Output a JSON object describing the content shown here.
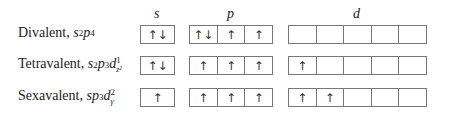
{
  "headers": {
    "s": "s",
    "p": "p",
    "d": "d"
  },
  "rows": [
    {
      "name": "Divalent, ",
      "config": [
        {
          "t": "s",
          "sup": "2"
        },
        {
          "t": "p",
          "sup": "4"
        }
      ],
      "s": [
        "↑↓"
      ],
      "p": [
        "↑↓",
        "↑",
        "↑"
      ],
      "d": [
        "",
        "",
        "",
        "",
        ""
      ]
    },
    {
      "name": "Tetravalent, ",
      "config": [
        {
          "t": "s",
          "sup": "2"
        },
        {
          "t": "p",
          "sup": "3"
        },
        {
          "t": "d",
          "sup": "1",
          "sub": "z²"
        }
      ],
      "s": [
        "↑↓"
      ],
      "p": [
        "↑",
        "↑",
        "↑"
      ],
      "d": [
        "↑",
        "",
        "",
        "",
        ""
      ]
    },
    {
      "name": "Sexavalent, ",
      "config": [
        {
          "t": "s"
        },
        {
          "t": "p",
          "sup": "3"
        },
        {
          "t": "d",
          "sup": "2",
          "sub": "γ"
        }
      ],
      "s": [
        "↑"
      ],
      "p": [
        "↑",
        "↑",
        "↑"
      ],
      "d": [
        "↑",
        "↑",
        "",
        "",
        ""
      ]
    }
  ]
}
